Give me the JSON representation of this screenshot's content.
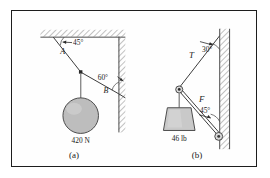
{
  "figure": {
    "panels": [
      {
        "id": "a",
        "caption": "(a)",
        "supports": [
          "ceiling-hatched",
          "wall-hatched"
        ],
        "labels": {
          "angle_ceiling": "45°",
          "angle_wall": "60°",
          "point_a": "A",
          "point_b": "B",
          "weight": "420 N"
        },
        "body": "sphere"
      },
      {
        "id": "b",
        "caption": "(b)",
        "supports": [
          "wall-hatched"
        ],
        "labels": {
          "cable_force": "T",
          "strut_force": "F",
          "angle_cable": "30°",
          "angle_strut": "45°",
          "weight": "46 lb"
        },
        "body": "trapezoid-block"
      }
    ]
  },
  "colors": {
    "frame": "#1d1d1d",
    "line": "#3a3a3a",
    "ball_fill": "#bdbdbd",
    "block_fill": "#c9c9c9",
    "hatch": "#8d8d8d",
    "background": "#ffffff"
  }
}
